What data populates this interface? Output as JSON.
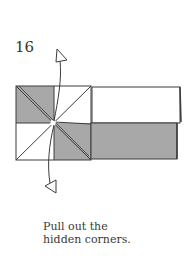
{
  "step": {
    "number": "16"
  },
  "caption": {
    "line1": "Pull out the",
    "line2": "hidden corners."
  },
  "colors": {
    "paper_gray": "#a8a8a8",
    "paper_white": "#ffffff",
    "line": "#3c3c3c"
  },
  "icons": {
    "up_arrow": "push-out-arrow-up",
    "down_arrow": "push-out-arrow-down"
  }
}
